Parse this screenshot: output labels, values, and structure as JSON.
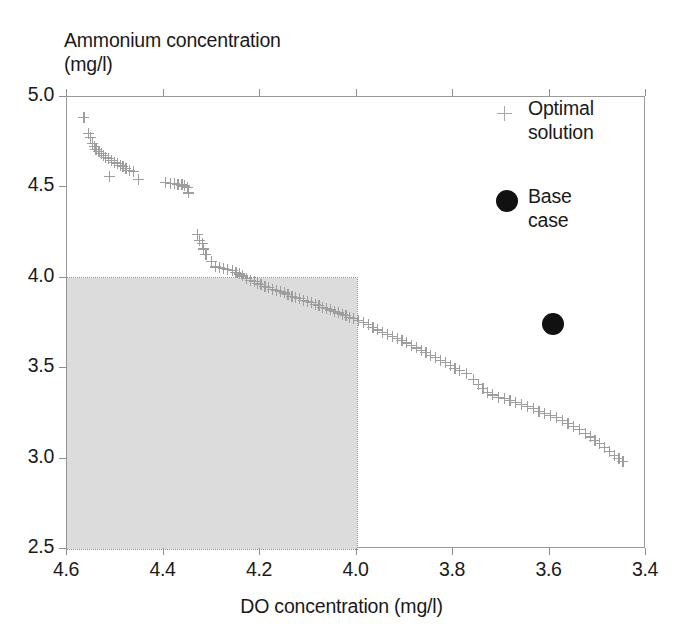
{
  "chart_data": {
    "type": "scatter",
    "title": "",
    "xlabel": "DO concentration (mg/l)",
    "ylabel": "Ammonium concentration\n(mg/l)",
    "xlim": [
      4.6,
      3.4
    ],
    "ylim": [
      2.5,
      5.0
    ],
    "x_reversed": true,
    "xticks": [
      "4.6",
      "4.4",
      "4.2",
      "4.0",
      "3.8",
      "3.6",
      "3.4"
    ],
    "xtick_values": [
      4.6,
      4.4,
      4.2,
      4.0,
      3.8,
      3.6,
      3.4
    ],
    "yticks": [
      "2.5",
      "3.0",
      "3.5",
      "4.0",
      "4.5",
      "5.0"
    ],
    "ytick_values": [
      2.5,
      3.0,
      3.5,
      4.0,
      4.5,
      5.0
    ],
    "grid": false,
    "legend_position": "top-right-inside",
    "shaded_region": {
      "label": "infeasible/constraint region",
      "x_range": [
        4.6,
        4.0
      ],
      "y_range": [
        2.5,
        4.0
      ],
      "fill": "#dcdcdc",
      "border_style": "dotted"
    },
    "series": [
      {
        "name": "Optimal solution",
        "marker": "plus",
        "color": "#9e9e9e",
        "points": [
          [
            4.565,
            4.885
          ],
          [
            4.556,
            4.8
          ],
          [
            4.552,
            4.775
          ],
          [
            4.548,
            4.745
          ],
          [
            4.544,
            4.728
          ],
          [
            4.54,
            4.712
          ],
          [
            4.534,
            4.7
          ],
          [
            4.528,
            4.69
          ],
          [
            4.524,
            4.678
          ],
          [
            4.52,
            4.668
          ],
          [
            4.514,
            4.66
          ],
          [
            4.508,
            4.65
          ],
          [
            4.502,
            4.64
          ],
          [
            4.496,
            4.632
          ],
          [
            4.49,
            4.622
          ],
          [
            4.484,
            4.614
          ],
          [
            4.478,
            4.604
          ],
          [
            4.47,
            4.596
          ],
          [
            4.462,
            4.588
          ],
          [
            4.512,
            4.562
          ],
          [
            4.452,
            4.545
          ],
          [
            4.396,
            4.528
          ],
          [
            4.386,
            4.524
          ],
          [
            4.378,
            4.52
          ],
          [
            4.37,
            4.518
          ],
          [
            4.362,
            4.514
          ],
          [
            4.356,
            4.508
          ],
          [
            4.35,
            4.5
          ],
          [
            4.348,
            4.47
          ],
          [
            4.33,
            4.24
          ],
          [
            4.326,
            4.208
          ],
          [
            4.32,
            4.192
          ],
          [
            4.318,
            4.16
          ],
          [
            4.312,
            4.13
          ],
          [
            4.3,
            4.092
          ],
          [
            4.292,
            4.06
          ],
          [
            4.284,
            4.056
          ],
          [
            4.276,
            4.05
          ],
          [
            4.268,
            4.046
          ],
          [
            4.258,
            4.04
          ],
          [
            4.25,
            4.032
          ],
          [
            4.242,
            4.022
          ],
          [
            4.236,
            4.01
          ],
          [
            4.228,
            3.998
          ],
          [
            4.22,
            3.986
          ],
          [
            4.212,
            3.978
          ],
          [
            4.206,
            3.968
          ],
          [
            4.198,
            3.962
          ],
          [
            4.19,
            3.954
          ],
          [
            4.182,
            3.946
          ],
          [
            4.174,
            3.938
          ],
          [
            4.166,
            3.932
          ],
          [
            4.158,
            3.924
          ],
          [
            4.15,
            3.916
          ],
          [
            4.142,
            3.906
          ],
          [
            4.134,
            3.898
          ],
          [
            4.126,
            3.89
          ],
          [
            4.118,
            3.884
          ],
          [
            4.11,
            3.876
          ],
          [
            4.102,
            3.868
          ],
          [
            4.094,
            3.862
          ],
          [
            4.086,
            3.854
          ],
          [
            4.078,
            3.846
          ],
          [
            4.07,
            3.838
          ],
          [
            4.062,
            3.83
          ],
          [
            4.054,
            3.822
          ],
          [
            4.046,
            3.814
          ],
          [
            4.038,
            3.806
          ],
          [
            4.03,
            3.798
          ],
          [
            4.022,
            3.79
          ],
          [
            4.014,
            3.782
          ],
          [
            4.006,
            3.776
          ],
          [
            3.996,
            3.764
          ],
          [
            3.986,
            3.752
          ],
          [
            3.976,
            3.74
          ],
          [
            3.966,
            3.726
          ],
          [
            3.956,
            3.712
          ],
          [
            3.946,
            3.7
          ],
          [
            3.936,
            3.688
          ],
          [
            3.926,
            3.676
          ],
          [
            3.916,
            3.664
          ],
          [
            3.906,
            3.652
          ],
          [
            3.896,
            3.64
          ],
          [
            3.886,
            3.626
          ],
          [
            3.876,
            3.612
          ],
          [
            3.866,
            3.598
          ],
          [
            3.856,
            3.586
          ],
          [
            3.846,
            3.572
          ],
          [
            3.836,
            3.558
          ],
          [
            3.826,
            3.542
          ],
          [
            3.816,
            3.53
          ],
          [
            3.806,
            3.516
          ],
          [
            3.796,
            3.5
          ],
          [
            3.786,
            3.486
          ],
          [
            3.772,
            3.472
          ],
          [
            3.758,
            3.44
          ],
          [
            3.748,
            3.412
          ],
          [
            3.738,
            3.388
          ],
          [
            3.728,
            3.368
          ],
          [
            3.718,
            3.352
          ],
          [
            3.706,
            3.34
          ],
          [
            3.694,
            3.332
          ],
          [
            3.682,
            3.322
          ],
          [
            3.67,
            3.312
          ],
          [
            3.658,
            3.3
          ],
          [
            3.646,
            3.288
          ],
          [
            3.634,
            3.276
          ],
          [
            3.622,
            3.262
          ],
          [
            3.61,
            3.25
          ],
          [
            3.598,
            3.238
          ],
          [
            3.586,
            3.226
          ],
          [
            3.574,
            3.212
          ],
          [
            3.562,
            3.196
          ],
          [
            3.55,
            3.178
          ],
          [
            3.538,
            3.16
          ],
          [
            3.526,
            3.14
          ],
          [
            3.516,
            3.12
          ],
          [
            3.506,
            3.102
          ],
          [
            3.496,
            3.082
          ],
          [
            3.486,
            3.06
          ],
          [
            3.476,
            3.04
          ],
          [
            3.466,
            3.016
          ],
          [
            3.456,
            3.0
          ],
          [
            3.448,
            2.985
          ]
        ]
      },
      {
        "name": "Base case",
        "marker": "circle",
        "color": "#111111",
        "points": [
          [
            3.592,
            3.742
          ]
        ]
      }
    ]
  },
  "legend": {
    "optimal_label": "Optimal\nsolution",
    "base_label": "Base\ncase"
  }
}
